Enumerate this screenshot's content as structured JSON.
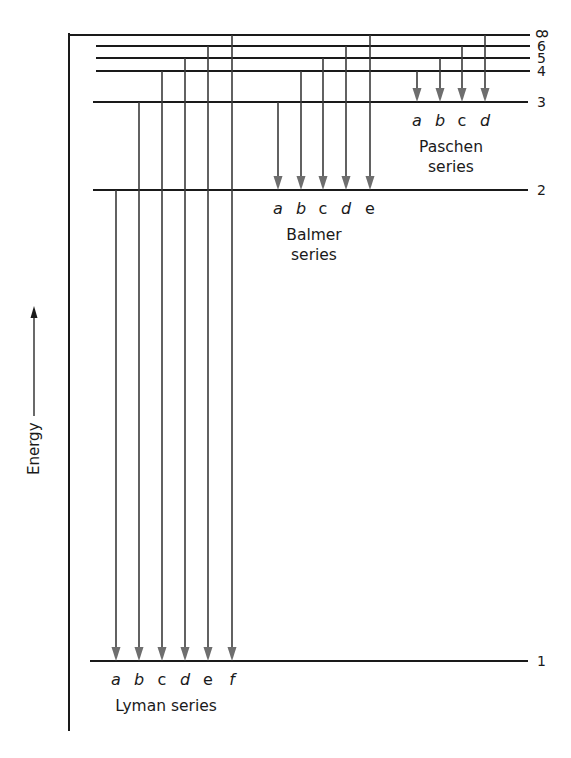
{
  "diagram": {
    "axis_label": "Energy",
    "levels": [
      {
        "n": "∞",
        "y": 35,
        "x_start": 69
      },
      {
        "n": "6",
        "y": 46,
        "x_start": 96
      },
      {
        "n": "5",
        "y": 58,
        "x_start": 96
      },
      {
        "n": "4",
        "y": 71,
        "x_start": 96
      },
      {
        "n": "3",
        "y": 102,
        "x_start": 93
      },
      {
        "n": "2",
        "y": 190,
        "x_start": 93
      },
      {
        "n": "1",
        "y": 661,
        "x_start": 90
      }
    ],
    "series": [
      {
        "name": "Lyman series",
        "title_lines": [
          "Lyman series"
        ],
        "target_level": "1",
        "transitions": [
          {
            "label": "a",
            "from": "2",
            "x": 116
          },
          {
            "label": "b",
            "from": "3",
            "x": 139
          },
          {
            "label": "c",
            "from": "4",
            "x": 162
          },
          {
            "label": "d",
            "from": "5",
            "x": 185
          },
          {
            "label": "e",
            "from": "6",
            "x": 208
          },
          {
            "label": "f",
            "from": "∞",
            "x": 232
          }
        ]
      },
      {
        "name": "Balmer series",
        "title_lines": [
          "Balmer",
          "series"
        ],
        "target_level": "2",
        "transitions": [
          {
            "label": "a",
            "from": "3",
            "x": 278
          },
          {
            "label": "b",
            "from": "4",
            "x": 301
          },
          {
            "label": "c",
            "from": "5",
            "x": 323
          },
          {
            "label": "d",
            "from": "6",
            "x": 346
          },
          {
            "label": "e",
            "from": "∞",
            "x": 370
          }
        ]
      },
      {
        "name": "Paschen series",
        "title_lines": [
          "Paschen",
          "series"
        ],
        "target_level": "3",
        "transitions": [
          {
            "label": "a",
            "from": "4",
            "x": 417
          },
          {
            "label": "b",
            "from": "5",
            "x": 440
          },
          {
            "label": "c",
            "from": "6",
            "x": 462
          },
          {
            "label": "d",
            "from": "∞",
            "x": 485
          }
        ]
      }
    ],
    "colors": {
      "line": "#1a1a1a",
      "arrow": "#6e6e6e",
      "background": "#ffffff"
    }
  }
}
